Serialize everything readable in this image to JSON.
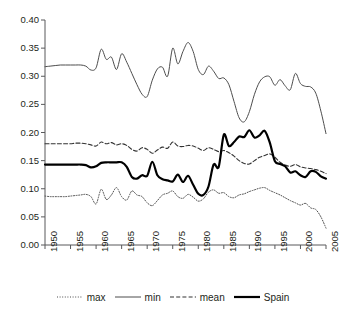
{
  "chart_data": {
    "type": "line",
    "title": "",
    "subtitle": "",
    "xlabel": "",
    "ylabel": "",
    "xlim": [
      1950,
      2005
    ],
    "ylim": [
      0.0,
      0.4
    ],
    "grid": false,
    "legend_position": "bottom",
    "x_ticks": [
      "1950",
      "1955",
      "1960",
      "1965",
      "1970",
      "1975",
      "1980",
      "1985",
      "1990",
      "1995",
      "2000",
      "2005"
    ],
    "x_tick_values": [
      1950,
      1955,
      1960,
      1965,
      1970,
      1975,
      1980,
      1985,
      1990,
      1995,
      2000,
      2005
    ],
    "y_ticks": [
      "0.00",
      "0.05",
      "0.10",
      "0.15",
      "0.20",
      "0.25",
      "0.30",
      "0.35",
      "0.40"
    ],
    "y_tick_values": [
      0.0,
      0.05,
      0.1,
      0.15,
      0.2,
      0.25,
      0.3,
      0.35,
      0.4
    ],
    "x": [
      1950,
      1951,
      1952,
      1953,
      1954,
      1955,
      1956,
      1957,
      1958,
      1959,
      1960,
      1961,
      1962,
      1963,
      1964,
      1965,
      1966,
      1967,
      1968,
      1969,
      1970,
      1971,
      1972,
      1973,
      1974,
      1975,
      1976,
      1977,
      1978,
      1979,
      1980,
      1981,
      1982,
      1983,
      1984,
      1985,
      1986,
      1987,
      1988,
      1989,
      1990,
      1991,
      1992,
      1993,
      1994,
      1995,
      1996,
      1997,
      1998,
      1999,
      2000,
      2001,
      2002,
      2003,
      2004,
      2005
    ],
    "series": [
      {
        "name": "max",
        "style": "dotted",
        "color": "#4d4d4d",
        "width": 1.0,
        "values": [
          0.087,
          0.086,
          0.086,
          0.086,
          0.086,
          0.087,
          0.088,
          0.089,
          0.09,
          0.086,
          0.073,
          0.099,
          0.081,
          0.089,
          0.102,
          0.086,
          0.08,
          0.096,
          0.089,
          0.086,
          0.075,
          0.07,
          0.079,
          0.089,
          0.092,
          0.096,
          0.086,
          0.083,
          0.09,
          0.085,
          0.078,
          0.082,
          0.094,
          0.098,
          0.092,
          0.093,
          0.086,
          0.084,
          0.089,
          0.091,
          0.095,
          0.098,
          0.101,
          0.102,
          0.097,
          0.093,
          0.089,
          0.084,
          0.079,
          0.075,
          0.071,
          0.074,
          0.066,
          0.063,
          0.05,
          0.03
        ]
      },
      {
        "name": "min",
        "style": "solid-thin",
        "color": "#4d4d4d",
        "width": 1.0,
        "values": [
          0.317,
          0.318,
          0.319,
          0.32,
          0.32,
          0.32,
          0.32,
          0.32,
          0.318,
          0.311,
          0.315,
          0.348,
          0.33,
          0.334,
          0.312,
          0.34,
          0.325,
          0.305,
          0.285,
          0.268,
          0.264,
          0.293,
          0.313,
          0.316,
          0.3,
          0.35,
          0.322,
          0.344,
          0.36,
          0.344,
          0.312,
          0.303,
          0.318,
          0.309,
          0.296,
          0.297,
          0.285,
          0.255,
          0.226,
          0.219,
          0.237,
          0.268,
          0.29,
          0.299,
          0.299,
          0.284,
          0.294,
          0.283,
          0.276,
          0.305,
          0.287,
          0.282,
          0.281,
          0.27,
          0.238,
          0.198
        ]
      },
      {
        "name": "mean",
        "style": "dashed",
        "color": "#333333",
        "width": 1.1,
        "values": [
          0.18,
          0.18,
          0.18,
          0.18,
          0.18,
          0.18,
          0.181,
          0.181,
          0.18,
          0.178,
          0.176,
          0.183,
          0.18,
          0.182,
          0.178,
          0.18,
          0.177,
          0.17,
          0.167,
          0.173,
          0.17,
          0.163,
          0.169,
          0.174,
          0.172,
          0.183,
          0.176,
          0.175,
          0.177,
          0.176,
          0.172,
          0.168,
          0.173,
          0.17,
          0.166,
          0.168,
          0.164,
          0.158,
          0.15,
          0.145,
          0.144,
          0.15,
          0.156,
          0.159,
          0.162,
          0.156,
          0.147,
          0.142,
          0.14,
          0.143,
          0.139,
          0.137,
          0.136,
          0.134,
          0.131,
          0.127
        ]
      },
      {
        "name": "Spain",
        "style": "solid-thick",
        "color": "#000000",
        "width": 2.2,
        "values": [
          0.143,
          0.143,
          0.143,
          0.143,
          0.143,
          0.143,
          0.143,
          0.143,
          0.142,
          0.138,
          0.14,
          0.146,
          0.147,
          0.147,
          0.147,
          0.147,
          0.139,
          0.121,
          0.118,
          0.124,
          0.123,
          0.148,
          0.124,
          0.117,
          0.115,
          0.113,
          0.125,
          0.112,
          0.123,
          0.107,
          0.091,
          0.089,
          0.104,
          0.143,
          0.139,
          0.196,
          0.176,
          0.183,
          0.193,
          0.192,
          0.204,
          0.191,
          0.195,
          0.203,
          0.182,
          0.149,
          0.144,
          0.14,
          0.129,
          0.131,
          0.124,
          0.121,
          0.131,
          0.13,
          0.122,
          0.118
        ]
      }
    ],
    "legend": [
      {
        "label": "max",
        "style": "dotted"
      },
      {
        "label": "min",
        "style": "solid-thin"
      },
      {
        "label": "mean",
        "style": "dashed"
      },
      {
        "label": "Spain",
        "style": "solid-thick"
      }
    ]
  }
}
